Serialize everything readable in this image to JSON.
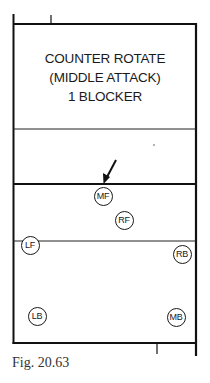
{
  "diagram": {
    "title_lines": [
      "COUNTER ROTATE",
      "(MIDDLE ATTACK)",
      "1 BLOCKER"
    ],
    "players": [
      {
        "id": "MF",
        "label": "MF",
        "x": 103,
        "y": 196
      },
      {
        "id": "RF",
        "label": "RF",
        "x": 124,
        "y": 220
      },
      {
        "id": "LF",
        "label": "LF",
        "x": 30,
        "y": 245
      },
      {
        "id": "RB",
        "label": "RB",
        "x": 182,
        "y": 254
      },
      {
        "id": "LB",
        "label": "LB",
        "x": 37,
        "y": 316
      },
      {
        "id": "MB",
        "label": "MB",
        "x": 176,
        "y": 317
      }
    ],
    "arrow": {
      "from": [
        116,
        160
      ],
      "to": [
        104,
        183
      ],
      "target": "MF"
    },
    "caption": "Fig. 20.63"
  }
}
